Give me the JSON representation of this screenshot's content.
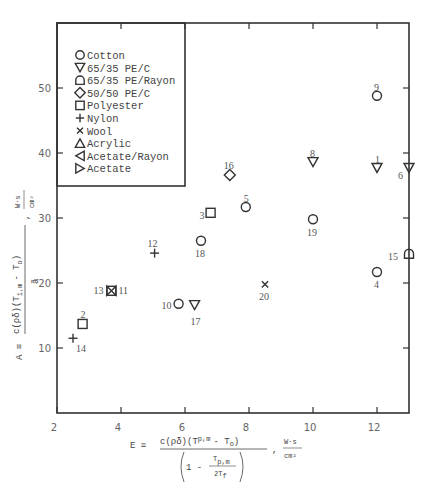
{
  "chart_data": {
    "type": "scatter",
    "title": "",
    "xlabel": "E ≡ c(ρδ)(T_p,m − T_o) / (1 − T_p,m / 2T_f) , W·s/cm²",
    "ylabel": "A ≡ c(ρδ)(T_i,m − T_o) / ã , W·s/cm²",
    "xlim": [
      2,
      13
    ],
    "ylim": [
      0,
      60
    ],
    "x_ticks": [
      2,
      4,
      6,
      8,
      10,
      12
    ],
    "y_ticks": [
      10,
      20,
      30,
      40,
      50
    ],
    "grid": false,
    "legend_position": "upper left",
    "legend": [
      {
        "symbol": "circle",
        "label": "Cotton"
      },
      {
        "symbol": "triangle-down",
        "label": "65/35 PE/C"
      },
      {
        "symbol": "bullet",
        "label": "65/35 PE/Rayon"
      },
      {
        "symbol": "diamond",
        "label": "50/50 PE/C"
      },
      {
        "symbol": "square",
        "label": "Polyester"
      },
      {
        "symbol": "plus",
        "label": "Nylon"
      },
      {
        "symbol": "x",
        "label": "Wool"
      },
      {
        "symbol": "triangle-up",
        "label": "Acrylic"
      },
      {
        "symbol": "triangle-left",
        "label": "Acetate/Rayon"
      },
      {
        "symbol": "triangle-right",
        "label": "Acetate"
      }
    ],
    "points": [
      {
        "id": "1",
        "material": "65/35 PE/C",
        "symbol": "triangle-down",
        "x": 12.0,
        "y": 37.7,
        "lx": -2,
        "ly": -8
      },
      {
        "id": "2",
        "material": "Polyester",
        "symbol": "square",
        "x": 2.8,
        "y": 13.7,
        "lx": -2,
        "ly": -9
      },
      {
        "id": "3",
        "material": "Polyester",
        "symbol": "square",
        "x": 6.8,
        "y": 30.8,
        "lx": -11,
        "ly": 3
      },
      {
        "id": "4",
        "material": "Cotton",
        "symbol": "circle",
        "x": 12.0,
        "y": 21.7,
        "lx": -3,
        "ly": 13
      },
      {
        "id": "5",
        "material": "Cotton",
        "symbol": "circle",
        "x": 7.9,
        "y": 31.7,
        "lx": -2,
        "ly": -8
      },
      {
        "id": "6",
        "material": "65/35 PE/C",
        "symbol": "triangle-down",
        "x": 13.0,
        "y": 37.7,
        "lx": -11,
        "ly": 8
      },
      {
        "id": "8",
        "material": "65/35 PE/C",
        "symbol": "triangle-down",
        "x": 10.0,
        "y": 38.6,
        "lx": -3,
        "ly": -8
      },
      {
        "id": "9",
        "material": "Cotton",
        "symbol": "circle",
        "x": 12.0,
        "y": 48.8,
        "lx": -3,
        "ly": -8
      },
      {
        "id": "10",
        "material": "Cotton",
        "symbol": "circle",
        "x": 5.8,
        "y": 16.8,
        "lx": -17,
        "ly": 2
      },
      {
        "id": "11",
        "material": "Acetate",
        "symbol": "bowtie",
        "x": 3.7,
        "y": 18.8,
        "lx": 7,
        "ly": 0
      },
      {
        "id": "12",
        "material": "Nylon",
        "symbol": "plus",
        "x": 5.05,
        "y": 24.6,
        "lx": -7,
        "ly": -9
      },
      {
        "id": "13",
        "material": "Acetate/Rayon",
        "symbol": "bowtie",
        "x": 3.7,
        "y": 18.8,
        "lx": -18,
        "ly": 0
      },
      {
        "id": "14",
        "material": "Nylon",
        "symbol": "plus",
        "x": 2.5,
        "y": 11.5,
        "lx": 3,
        "ly": 11
      },
      {
        "id": "15",
        "material": "65/35 PE/Rayon",
        "symbol": "bullet",
        "x": 13.0,
        "y": 24.5,
        "lx": -21,
        "ly": 3
      },
      {
        "id": "16",
        "material": "50/50 PE/C",
        "symbol": "diamond",
        "x": 7.4,
        "y": 36.6,
        "lx": -6,
        "ly": -9
      },
      {
        "id": "17",
        "material": "65/35 PE/C",
        "symbol": "triangle-down",
        "x": 6.3,
        "y": 16.6,
        "lx": -4,
        "ly": 17
      },
      {
        "id": "18",
        "material": "Cotton",
        "symbol": "circle",
        "x": 6.5,
        "y": 26.5,
        "lx": -6,
        "ly": 13
      },
      {
        "id": "19",
        "material": "Cotton",
        "symbol": "circle",
        "x": 10.0,
        "y": 29.8,
        "lx": -6,
        "ly": 14
      },
      {
        "id": "20",
        "material": "Wool",
        "symbol": "x",
        "x": 8.5,
        "y": 19.8,
        "lx": -6,
        "ly": 13
      }
    ]
  },
  "axes": {
    "x_tick_labels": [
      "2",
      "4",
      "6",
      "8",
      "10",
      "12"
    ],
    "y_tick_labels": [
      "10",
      "20",
      "30",
      "40",
      "50"
    ],
    "xlabel_parts": {
      "prefix": "E ≡",
      "numerator": "c(ρδ)(T",
      "num_sub": "p,m",
      "num_mid": "- T",
      "num_sub2": "o",
      "denominator": "1 - ",
      "den_frac_top": "T",
      "den_frac_top_sub": "p,m",
      "den_frac_bottom": "2T",
      "den_frac_bottom_sub": "f",
      "units_top": "W·s",
      "units_bottom": "cm²"
    },
    "ylabel_parts": {
      "prefix": "A ≡",
      "numerator": "c(ρδ)(T",
      "num_sub": "i,m",
      "num_mid": "- T",
      "num_sub2": "o",
      "denominator": "ã",
      "units_top": "W·s",
      "units_bottom": "cm²"
    }
  }
}
